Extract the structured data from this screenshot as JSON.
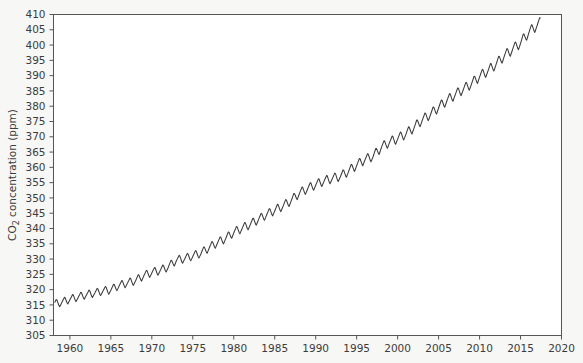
{
  "chart_data": {
    "type": "line",
    "title": "",
    "xlabel": "",
    "ylabel": "CO2 concentration (ppm)",
    "ylabel_parts": {
      "pre": "CO",
      "sub": "2",
      "post": " concentration (ppm)"
    },
    "xlim": [
      1958.0,
      2020.0
    ],
    "ylim": [
      305,
      410
    ],
    "grid": false,
    "legend": null,
    "line_color": "#3a3a3a",
    "plot_background": "#ffffff",
    "figure_background": "#f7f7f5",
    "axis_color": "#555555",
    "xticks": [
      1960,
      1965,
      1970,
      1975,
      1980,
      1985,
      1990,
      1995,
      2000,
      2005,
      2010,
      2015,
      2020
    ],
    "xtick_labels": [
      "1960",
      "1965",
      "1970",
      "1975",
      "1980",
      "1985",
      "1990",
      "1995",
      "2000",
      "2005",
      "2010",
      "2015",
      "2020"
    ],
    "yticks": [
      305,
      310,
      315,
      320,
      325,
      330,
      335,
      340,
      345,
      350,
      355,
      360,
      365,
      370,
      375,
      380,
      385,
      390,
      395,
      400,
      405,
      410
    ],
    "ytick_labels": [
      "305",
      "310",
      "315",
      "320",
      "325",
      "330",
      "335",
      "340",
      "345",
      "350",
      "355",
      "360",
      "365",
      "370",
      "375",
      "380",
      "385",
      "390",
      "395",
      "400",
      "405",
      "410"
    ],
    "series_name": "Mauna Loa monthly mean CO2",
    "seasonal_amplitude_ppm": 3.2,
    "annual_mean": {
      "x": [
        1958,
        1959,
        1960,
        1961,
        1962,
        1963,
        1964,
        1965,
        1966,
        1967,
        1968,
        1969,
        1970,
        1971,
        1972,
        1973,
        1974,
        1975,
        1976,
        1977,
        1978,
        1979,
        1980,
        1981,
        1982,
        1983,
        1984,
        1985,
        1986,
        1987,
        1988,
        1989,
        1990,
        1991,
        1992,
        1993,
        1994,
        1995,
        1996,
        1997,
        1998,
        1999,
        2000,
        2001,
        2002,
        2003,
        2004,
        2005,
        2006,
        2007,
        2008,
        2009,
        2010,
        2011,
        2012,
        2013,
        2014,
        2015,
        2016,
        2017
      ],
      "y": [
        315.3,
        315.9,
        316.9,
        317.6,
        318.4,
        318.9,
        319.6,
        320.0,
        321.4,
        322.2,
        323.0,
        324.6,
        325.7,
        326.3,
        327.5,
        329.7,
        330.2,
        331.1,
        332.0,
        333.8,
        335.4,
        336.8,
        338.8,
        340.1,
        341.4,
        343.0,
        344.6,
        346.0,
        347.4,
        349.2,
        351.6,
        353.1,
        354.4,
        355.6,
        356.4,
        357.1,
        358.8,
        360.8,
        362.6,
        363.7,
        366.6,
        368.3,
        369.5,
        371.0,
        373.1,
        375.6,
        377.4,
        379.7,
        381.9,
        383.8,
        385.6,
        387.4,
        389.8,
        391.6,
        393.8,
        396.5,
        398.6,
        400.8,
        404.2,
        406.5
      ]
    }
  }
}
